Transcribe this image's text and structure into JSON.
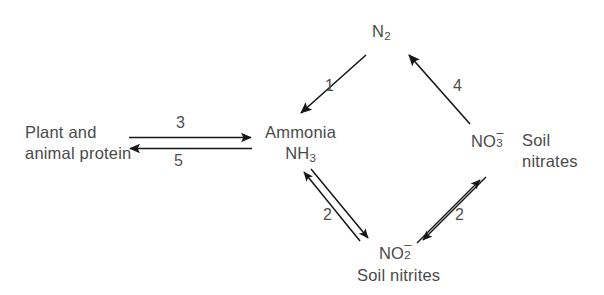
{
  "diagram": {
    "background_color": "#ffffff",
    "text_color": "#4a4a4a",
    "arrow_color": "#161616",
    "nodes": {
      "protein": {
        "line1": "Plant and",
        "line2": "animal protein"
      },
      "n2": {
        "base": "N",
        "subscript": "2"
      },
      "ammonia": {
        "name": "Ammonia",
        "formula_base": "NH",
        "formula_subscript": "3"
      },
      "nitrate": {
        "base": "NO",
        "subscript": "3",
        "charge": "–",
        "caption_line1": "Soil",
        "caption_line2": "nitrates"
      },
      "nitrite": {
        "base": "NO",
        "subscript": "2",
        "charge": "–",
        "caption": "Soil nitrites"
      }
    },
    "edges": [
      {
        "id": "n2-to-ammonia",
        "label": "1",
        "direction": "n2 → ammonia"
      },
      {
        "id": "ammonia-to-nitrite",
        "label": "2",
        "direction": "ammonia ↔ nitrite"
      },
      {
        "id": "nitrite-to-nitrate",
        "label": "2",
        "direction": "nitrite ↔ nitrate"
      },
      {
        "id": "nitrate-to-n2",
        "label": "4",
        "direction": "nitrate → n2"
      },
      {
        "id": "protein-to-ammonia",
        "label": "3",
        "direction": "protein → ammonia"
      },
      {
        "id": "ammonia-to-protein",
        "label": "5",
        "direction": "ammonia → protein"
      }
    ]
  }
}
